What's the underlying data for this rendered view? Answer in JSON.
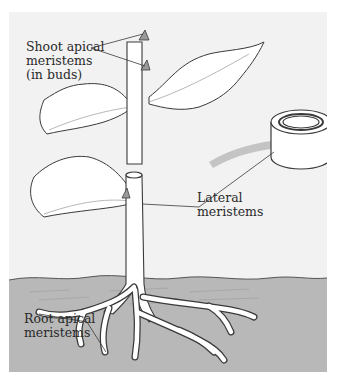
{
  "figure": {
    "labels": {
      "shoot_apical": "Shoot apical\nmeristems\n(in buds)",
      "lateral": "Lateral\nmeristems",
      "root_apical": "Root apical\nmeristems"
    },
    "colors": {
      "panel_bg": "#f2f2f2",
      "soil": "#b8b8b8",
      "soil_top": "#a9a9a9",
      "arrow": "#bdbdbd",
      "outline": "#3a3a3a",
      "plant_fill": "#ffffff",
      "bud": "#9a9a9a"
    }
  }
}
